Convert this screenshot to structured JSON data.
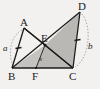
{
  "figure": {
    "width": 100,
    "height": 89,
    "background_color": "#f2f1ef",
    "stroke_color": "#1b1b1b",
    "shade_color": "#b9b8b4",
    "dash_color": "#8a8984"
  },
  "points": {
    "A": {
      "label": "A",
      "x": 24,
      "y": 28,
      "label_x": 20,
      "label_y": 17
    },
    "B": {
      "label": "B",
      "x": 12,
      "y": 68,
      "label_x": 8,
      "label_y": 71
    },
    "C": {
      "label": "C",
      "x": 73,
      "y": 68,
      "label_x": 69,
      "label_y": 71
    },
    "D": {
      "label": "D",
      "x": 80,
      "y": 12,
      "label_x": 78,
      "label_y": 1
    },
    "E": {
      "label": "E",
      "x": 45,
      "y": 45,
      "label_x": 41,
      "label_y": 33
    },
    "F": {
      "label": "F",
      "x": 36,
      "y": 68,
      "label_x": 32,
      "label_y": 71
    }
  },
  "segment_labels": [
    {
      "name": "a",
      "text": "a",
      "x": 3,
      "y": 44
    },
    {
      "name": "b",
      "text": "b",
      "x": 88,
      "y": 42
    },
    {
      "name": "x",
      "text": "x",
      "x": 39,
      "y": 56
    }
  ],
  "edges": [
    {
      "name": "B-A",
      "from": "B",
      "to": "A"
    },
    {
      "name": "A-E",
      "from": "A",
      "to": "E"
    },
    {
      "name": "B-C",
      "from": "B",
      "to": "C"
    },
    {
      "name": "B-D",
      "from": "B",
      "to": "D"
    },
    {
      "name": "D-C",
      "from": "D",
      "to": "C"
    },
    {
      "name": "E-C",
      "from": "E",
      "to": "C"
    },
    {
      "name": "E-F",
      "from": "E",
      "to": "F"
    }
  ],
  "shaded_regions": [
    {
      "name": "triangle-E-D-C",
      "vertices": "E,D,C"
    },
    {
      "name": "triangle-B-F-E",
      "vertices": "B,F,E"
    }
  ],
  "tick_marks": [
    {
      "name": "tick-on-AB",
      "segment": "B-A"
    },
    {
      "name": "tick-on-DC",
      "segment": "D-C"
    }
  ],
  "arcs": [
    {
      "name": "arc-left-a",
      "near": "a"
    },
    {
      "name": "arc-right-b",
      "near": "b"
    }
  ]
}
